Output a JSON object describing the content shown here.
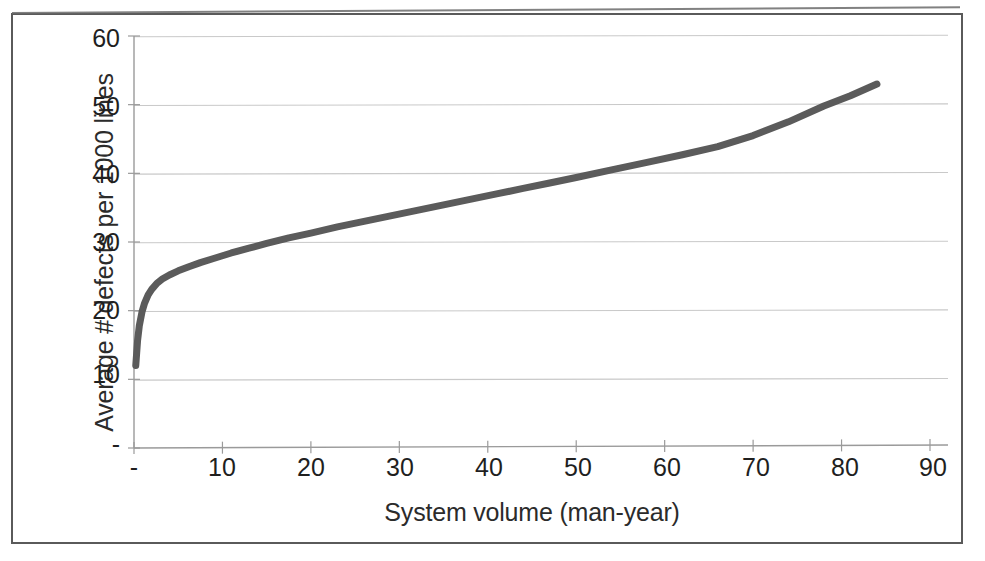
{
  "chart_data": {
    "type": "line",
    "title": "",
    "xlabel": "System volume (man-year)",
    "ylabel": "Average # defects per 1000 lines",
    "xlim": [
      0,
      90
    ],
    "ylim": [
      0,
      60
    ],
    "xticks": [
      "-",
      "10",
      "20",
      "30",
      "40",
      "50",
      "60",
      "70",
      "80",
      "90"
    ],
    "xtick_values": [
      0,
      10,
      20,
      30,
      40,
      50,
      60,
      70,
      80,
      90
    ],
    "yticks": [
      "-",
      "10",
      "20",
      "30",
      "40",
      "50",
      "60"
    ],
    "ytick_values": [
      0,
      10,
      20,
      30,
      40,
      50,
      60
    ],
    "grid": "horizontal",
    "legend": "none",
    "series": [
      {
        "name": "Average # defects per 1000 lines",
        "color": "#5b5b5b",
        "line_width": 7,
        "x": [
          0.2,
          0.4,
          0.6,
          0.9,
          1.2,
          1.6,
          2.0,
          2.6,
          3.2,
          4.0,
          5.0,
          6.2,
          7.5,
          9.0,
          11.0,
          13.0,
          15.0,
          17.5,
          20.0,
          23.0,
          26.0,
          29.0,
          32.0,
          35.0,
          38.0,
          41.0,
          44.0,
          47.0,
          50.0,
          54.0,
          58.0,
          62.0,
          66.0,
          70.0,
          74.0,
          78.0,
          81.0,
          84.0
        ],
        "y": [
          12.0,
          15.6,
          17.8,
          19.8,
          21.1,
          22.3,
          23.1,
          24.0,
          24.6,
          25.2,
          25.8,
          26.4,
          27.0,
          27.6,
          28.4,
          29.1,
          29.8,
          30.6,
          31.3,
          32.2,
          33.0,
          33.8,
          34.6,
          35.4,
          36.2,
          37.0,
          37.8,
          38.6,
          39.4,
          40.5,
          41.6,
          42.7,
          43.9,
          45.5,
          47.5,
          49.8,
          51.3,
          53.0
        ]
      }
    ]
  },
  "axes": {
    "ylabel": "Average # defects per 1000 lines",
    "xlabel": "System volume (man-year)"
  }
}
